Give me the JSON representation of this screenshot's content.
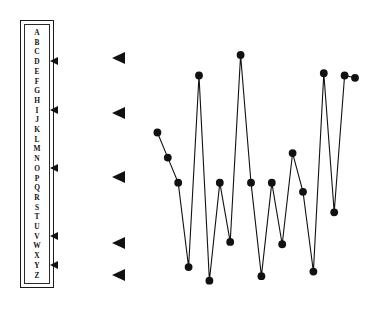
{
  "canvas": {
    "width": 374,
    "height": 309,
    "background": "#ffffff",
    "ink": "#111111"
  },
  "alpha_index": {
    "name": "alphabet-index",
    "letters": [
      "A",
      "B",
      "C",
      "D",
      "E",
      "F",
      "G",
      "H",
      "I",
      "J",
      "K",
      "L",
      "M",
      "N",
      "O",
      "P",
      "Q",
      "R",
      "S",
      "T",
      "U",
      "V",
      "W",
      "X",
      "Y",
      "Z"
    ],
    "selected_letters": [
      "D",
      "I",
      "O",
      "V",
      "Y"
    ],
    "marker_icon": "left-pointing-triangle",
    "border_color": "#1a1a1a"
  },
  "marker_column": {
    "name": "row-pointer-column",
    "icon": "left-pointing-triangle",
    "color": "#111111",
    "markers": [
      {
        "label": "D",
        "y": 58
      },
      {
        "label": "I",
        "y": 113
      },
      {
        "label": "O",
        "y": 177
      },
      {
        "label": "V",
        "y": 243
      },
      {
        "label": "Y",
        "y": 275
      }
    ]
  },
  "chart_data": {
    "type": "line",
    "title": "",
    "subtitle": "",
    "xlabel": "",
    "ylabel": "",
    "grid": false,
    "legend": null,
    "marker": "filled-circle",
    "marker_color": "#111111",
    "line_color": "#111111",
    "xlim": [
      0,
      20
    ],
    "ylim": [
      0,
      100
    ],
    "x": [
      1,
      2,
      3,
      4,
      5,
      6,
      7,
      8,
      9,
      10,
      11,
      12,
      13,
      14,
      15,
      16,
      17,
      18,
      19,
      20
    ],
    "values": [
      66,
      55,
      44,
      7,
      91,
      1,
      44,
      18,
      100,
      44,
      3,
      44,
      17,
      57,
      40,
      5,
      92,
      31,
      91,
      90
    ],
    "xticklabels": [],
    "yticklabels": []
  }
}
